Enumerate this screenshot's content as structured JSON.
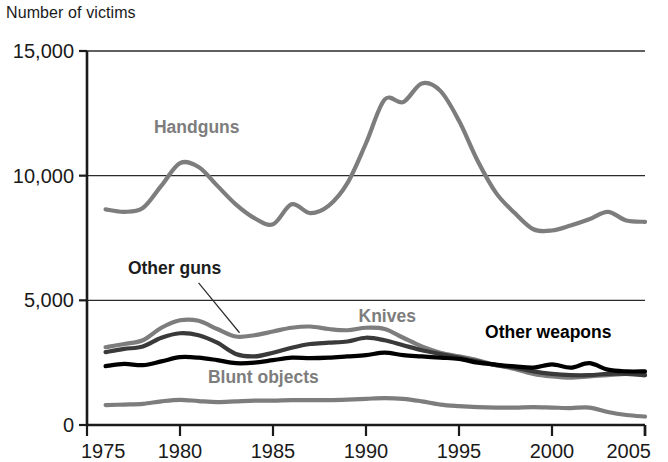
{
  "chart_data": {
    "type": "line",
    "title": "",
    "ylabel": "Number of victims",
    "xlabel": "",
    "ylim": [
      0,
      15000
    ],
    "xlim": [
      1975,
      2005
    ],
    "grid": true,
    "legend_position": "inline-annotations",
    "y_ticks": [
      "0",
      "5,000",
      "10,000",
      "15,000"
    ],
    "y_tick_values": [
      0,
      5000,
      10000,
      15000
    ],
    "x_ticks": [
      "1975",
      "1980",
      "1985",
      "1990",
      "1995",
      "2000",
      "2005"
    ],
    "x_tick_values": [
      1975,
      1980,
      1985,
      1990,
      1995,
      2000,
      2005
    ],
    "x": [
      1976,
      1977,
      1978,
      1979,
      1980,
      1981,
      1982,
      1983,
      1984,
      1985,
      1986,
      1987,
      1988,
      1989,
      1990,
      1991,
      1992,
      1993,
      1994,
      1995,
      1996,
      1997,
      1998,
      1999,
      2000,
      2001,
      2002,
      2003,
      2004,
      2005
    ],
    "series": [
      {
        "name": "Handguns",
        "color": "#7d7d7d",
        "label_x": 1978.6,
        "label_y": 11700,
        "values": [
          8650,
          8550,
          8700,
          9600,
          10500,
          10350,
          9600,
          8850,
          8300,
          8050,
          8850,
          8500,
          8800,
          9700,
          11300,
          13050,
          12950,
          13700,
          13400,
          12200,
          10600,
          9300,
          8500,
          7850,
          7800,
          8000,
          8250,
          8550,
          8200,
          8150
        ]
      },
      {
        "name": "Knives",
        "color": "#7d7d7d",
        "label_x": 1989.6,
        "label_y": 4150,
        "values": [
          3120,
          3250,
          3400,
          3900,
          4200,
          4180,
          3850,
          3550,
          3600,
          3750,
          3900,
          3950,
          3850,
          3800,
          3900,
          3850,
          3500,
          3150,
          2900,
          2750,
          2600,
          2400,
          2250,
          2050,
          1950,
          1900,
          1950,
          2000,
          2050,
          2000
        ]
      },
      {
        "name": "Other guns",
        "color": "#3a3a3a",
        "label_x": 1977.2,
        "label_y": 6050,
        "leader": {
          "x1": 1981.0,
          "y1": 5700,
          "x2": 1983.2,
          "y2": 3700
        },
        "values": [
          2920,
          3050,
          3150,
          3500,
          3680,
          3600,
          3300,
          2850,
          2750,
          2900,
          3100,
          3250,
          3300,
          3350,
          3500,
          3400,
          3200,
          3000,
          2850,
          2700,
          2550,
          2400,
          2300,
          2150,
          2050,
          2000,
          2000,
          2050,
          2050,
          2000
        ]
      },
      {
        "name": "Other weapons",
        "color": "#000000",
        "label_x": 1996.4,
        "label_y": 3500,
        "values": [
          2360,
          2450,
          2400,
          2550,
          2720,
          2700,
          2600,
          2480,
          2500,
          2600,
          2700,
          2680,
          2700,
          2750,
          2800,
          2900,
          2800,
          2750,
          2700,
          2650,
          2500,
          2420,
          2350,
          2300,
          2430,
          2300,
          2480,
          2220,
          2150,
          2150
        ]
      },
      {
        "name": "Blunt objects",
        "color": "#7d7d7d",
        "label_x": 1981.5,
        "label_y": 1700,
        "values": [
          800,
          820,
          850,
          950,
          1010,
          960,
          920,
          950,
          980,
          980,
          1000,
          1000,
          1000,
          1020,
          1050,
          1080,
          1050,
          950,
          820,
          760,
          720,
          700,
          700,
          720,
          700,
          680,
          700,
          520,
          400,
          340
        ]
      }
    ]
  }
}
